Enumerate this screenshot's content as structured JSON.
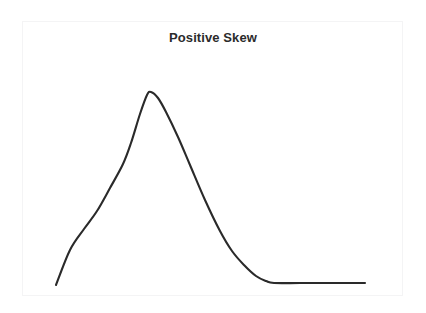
{
  "figure": {
    "background_color": "#ffffff",
    "frame_color": "#f4f4f5"
  },
  "title": {
    "text": "Positive Skew",
    "color": "#2b2b2b"
  },
  "chart_data": {
    "type": "line",
    "title": "Positive Skew",
    "subtitle": "",
    "xlabel": "",
    "ylabel": "",
    "xticks": [],
    "yticks": [],
    "xticklabels": [],
    "yticklabels": [],
    "grid": false,
    "legend": null,
    "legend_position": "none",
    "axes_visible": false,
    "series": [
      {
        "name": "Positive Skew",
        "color": "#2a2a2a",
        "line_width": 2,
        "description": "Right-skewed (positively skewed) probability density curve: short steep left tail, single mode left of center, long flat tail extending to the right.",
        "x": [
          0.0,
          0.04,
          0.08,
          0.12,
          0.16,
          0.2,
          0.24,
          0.28,
          0.31,
          0.34,
          0.38,
          0.42,
          0.46,
          0.5,
          0.55,
          0.6,
          0.64,
          0.68,
          0.72,
          0.76,
          0.8,
          0.86,
          0.92,
          1.0
        ],
        "y": [
          0.01,
          0.13,
          0.23,
          0.32,
          0.43,
          0.55,
          0.67,
          0.8,
          0.93,
          1.0,
          0.98,
          0.9,
          0.76,
          0.6,
          0.42,
          0.27,
          0.17,
          0.11,
          0.06,
          0.03,
          0.01,
          0.01,
          0.01,
          0.01
        ],
        "points_px": [
          [
            56,
            285
          ],
          [
            70,
            250
          ],
          [
            84,
            229
          ],
          [
            97,
            211
          ],
          [
            110,
            188
          ],
          [
            123,
            164
          ],
          [
            131,
            143
          ],
          [
            140,
            114
          ],
          [
            147,
            95
          ],
          [
            151,
            92
          ],
          [
            158,
            98
          ],
          [
            166,
            112
          ],
          [
            178,
            137
          ],
          [
            190,
            165
          ],
          [
            205,
            200
          ],
          [
            220,
            231
          ],
          [
            232,
            251
          ],
          [
            244,
            265
          ],
          [
            256,
            276
          ],
          [
            266,
            281
          ],
          [
            274,
            283
          ],
          [
            300,
            283
          ],
          [
            330,
            283
          ],
          [
            365,
            283
          ]
        ]
      }
    ],
    "annotations": [],
    "skewness": "positive",
    "mode_x_px": 151,
    "baseline_y_px": 283
  },
  "axes": {
    "x_axis_visible": false,
    "y_axis_visible": false
  }
}
